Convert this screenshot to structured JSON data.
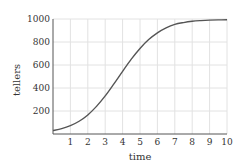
{
  "chart_data": {
    "type": "line",
    "title": "",
    "xlabel": "time",
    "ylabel": "tellers",
    "xlim": [
      0,
      10
    ],
    "ylim": [
      0,
      1000
    ],
    "xticks": [
      1,
      2,
      3,
      4,
      5,
      6,
      7,
      8,
      9,
      10
    ],
    "yticks": [
      200,
      400,
      600,
      800,
      1000
    ],
    "grid": true,
    "series": [
      {
        "name": "tellers",
        "color": "#555555",
        "x": [
          0,
          0.5,
          1,
          1.5,
          2,
          2.5,
          3,
          3.5,
          4,
          4.5,
          5,
          5.5,
          6,
          6.5,
          7,
          7.5,
          8,
          8.5,
          9,
          9.5,
          10
        ],
        "y": [
          30,
          47,
          73,
          111,
          166,
          240,
          331,
          436,
          545,
          651,
          744,
          821,
          880,
          923,
          953,
          969,
          980,
          986,
          990,
          992,
          993
        ]
      }
    ]
  }
}
